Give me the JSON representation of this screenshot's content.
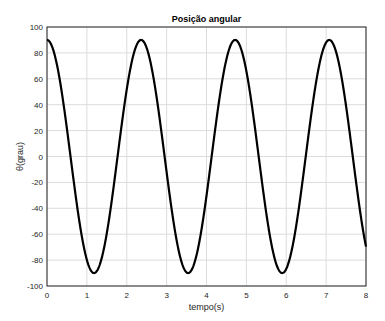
{
  "chart_data": {
    "type": "line",
    "title": "Posição angular",
    "xlabel": "tempo(s)",
    "ylabel": "θ(grau)",
    "xlim": [
      0,
      8
    ],
    "ylim": [
      -100,
      100
    ],
    "xticks": [
      0,
      1,
      2,
      3,
      4,
      5,
      6,
      7,
      8
    ],
    "yticks": [
      100,
      80,
      60,
      40,
      20,
      0,
      -20,
      -40,
      -60,
      -80,
      -100
    ],
    "grid": true,
    "series": [
      {
        "name": "theta",
        "x": [
          0,
          0.5,
          1.0,
          1.18,
          1.5,
          2.0,
          2.36,
          2.5,
          3.0,
          3.54,
          4.0,
          4.5,
          4.72,
          5.0,
          5.5,
          5.9,
          6.0,
          6.5,
          7.08,
          7.5,
          8.0
        ],
        "values": [
          90,
          22,
          -80,
          -90,
          -66,
          57,
          90,
          84,
          -13,
          -90,
          -37,
          60,
          90,
          80,
          -35,
          -90,
          -87,
          15,
          90,
          43,
          -66
        ]
      }
    ],
    "model": {
      "amplitude": 90,
      "omega": 2.663
    }
  }
}
